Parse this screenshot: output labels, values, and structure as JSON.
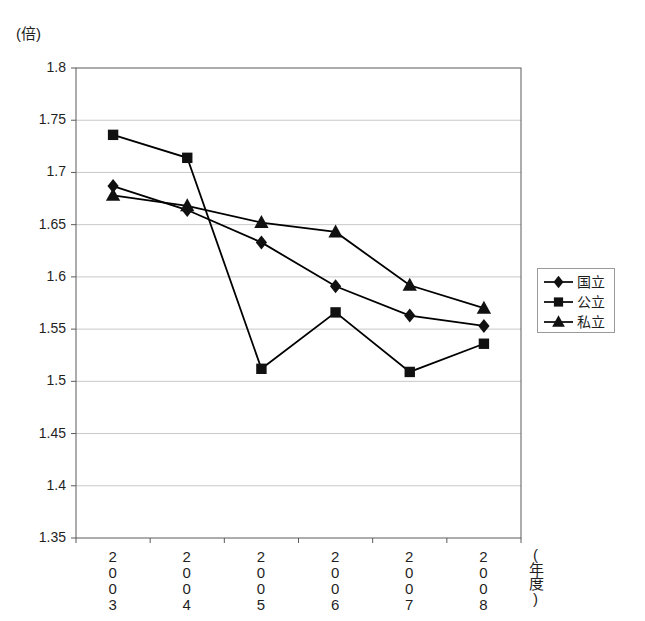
{
  "chart_data": {
    "type": "line",
    "title": "",
    "unit_label": "(倍)",
    "xlabel": "(年度)",
    "ylabel": "",
    "categories": [
      "2003",
      "2004",
      "2005",
      "2006",
      "2007",
      "2008"
    ],
    "ylim": [
      1.35,
      1.8
    ],
    "yticks": [
      "1.8",
      "1.75",
      "1.7",
      "1.65",
      "1.6",
      "1.55",
      "1.5",
      "1.45",
      "1.4",
      "1.35"
    ],
    "ytick_values": [
      1.8,
      1.75,
      1.7,
      1.65,
      1.6,
      1.55,
      1.5,
      1.45,
      1.4,
      1.35
    ],
    "grid": true,
    "grid_axis": "y",
    "legend_position": "right",
    "series": [
      {
        "name": "国立",
        "marker": "diamond",
        "color": "#000000",
        "values": [
          1.687,
          1.664,
          1.633,
          1.591,
          1.563,
          1.553
        ]
      },
      {
        "name": "公立",
        "marker": "square",
        "color": "#000000",
        "values": [
          1.736,
          1.714,
          1.512,
          1.566,
          1.509,
          1.536
        ]
      },
      {
        "name": "私立",
        "marker": "triangle",
        "color": "#000000",
        "values": [
          1.678,
          1.668,
          1.652,
          1.643,
          1.592,
          1.57
        ]
      }
    ]
  },
  "legend": {
    "items": [
      {
        "label": "国立",
        "marker": "diamond"
      },
      {
        "label": "公立",
        "marker": "square"
      },
      {
        "label": "私立",
        "marker": "triangle"
      }
    ]
  },
  "axes": {
    "x_title": "(年度)",
    "y_unit": "(倍)"
  }
}
